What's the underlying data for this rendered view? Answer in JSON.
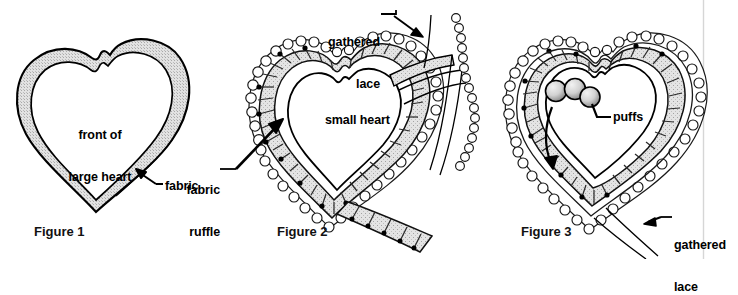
{
  "page": {
    "background_color": "#ffffff",
    "ink_color": "#000000",
    "fabric_fill_color": "#d9d9d9",
    "lace_fill_color": "#fdfdfd",
    "puff_fill_color": "#c9c9c9",
    "margin_rule_color": "#d2d2d2",
    "width": 738,
    "height": 259
  },
  "figures": [
    {
      "id": "figure-1",
      "caption": "Figure 1",
      "labels": [
        {
          "id": "front-of-large-heart",
          "lines": [
            "front of",
            "large heart"
          ],
          "text": "front of\nlarge heart"
        },
        {
          "id": "fabric",
          "lines": [
            "fabric"
          ],
          "text": "fabric"
        }
      ]
    },
    {
      "id": "figure-2",
      "caption": "Figure 2",
      "labels": [
        {
          "id": "gathered-lace",
          "lines": [
            "gathered",
            "lace"
          ],
          "text": "gathered\nlace"
        },
        {
          "id": "small-heart",
          "lines": [
            "small heart"
          ],
          "text": "small heart"
        },
        {
          "id": "fabric-ruffle",
          "lines": [
            "fabric",
            "ruffle"
          ],
          "text": "fabric\nruffle"
        }
      ]
    },
    {
      "id": "figure-3",
      "caption": "Figure 3",
      "labels": [
        {
          "id": "puffs",
          "lines": [
            "puffs"
          ],
          "text": "puffs"
        },
        {
          "id": "gathered-lace",
          "lines": [
            "gathered",
            "lace"
          ],
          "text": "gathered\nlace"
        }
      ]
    }
  ],
  "text": {
    "fig1_caption": "Figure 1",
    "fig1_front_of_large_heart_l1": "front of",
    "fig1_front_of_large_heart_l2": "large heart",
    "fig1_fabric": "fabric",
    "fig2_caption": "Figure 2",
    "fig2_gathered_lace_l1": "gathered",
    "fig2_gathered_lace_l2": "lace",
    "fig2_small_heart": "small heart",
    "fig2_fabric_ruffle_l1": "fabric",
    "fig2_fabric_ruffle_l2": "ruffle",
    "fig3_caption": "Figure 3",
    "fig3_puffs": "puffs",
    "fig3_gathered_lace_l1": "gathered",
    "fig3_gathered_lace_l2": "lace"
  }
}
